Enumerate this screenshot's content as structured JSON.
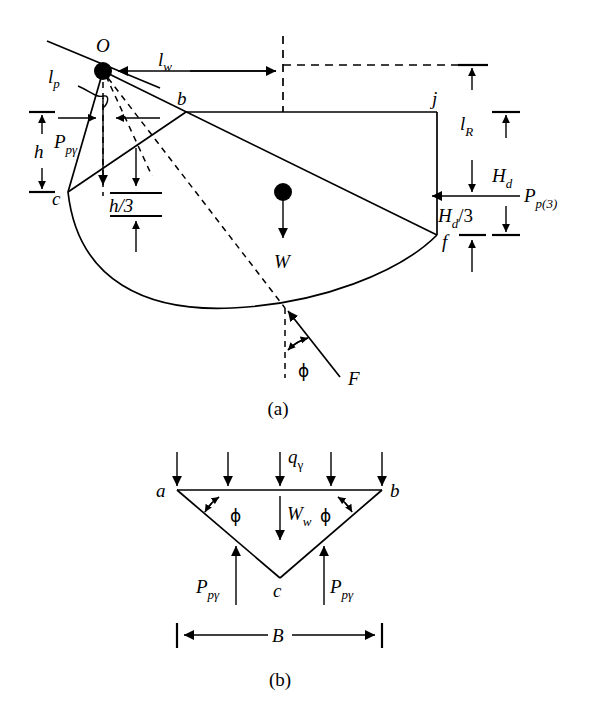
{
  "figure": {
    "title_panels": [
      "(a)",
      "(b)"
    ],
    "background_color": "#ffffff",
    "line_color": "#000000"
  },
  "panel_a": {
    "caption": "(a)",
    "points": [
      {
        "key": "O",
        "label": "O"
      },
      {
        "key": "b",
        "label": "b"
      },
      {
        "key": "c",
        "label": "c"
      },
      {
        "key": "f",
        "label": "f"
      },
      {
        "key": "j",
        "label": "j"
      }
    ],
    "dimensions": [
      {
        "key": "l_w",
        "base": "l",
        "sub": "w"
      },
      {
        "key": "l_p",
        "base": "l",
        "sub": "p"
      },
      {
        "key": "l_R",
        "base": "l",
        "sub": "R"
      },
      {
        "key": "h",
        "base": "h",
        "sub": ""
      },
      {
        "key": "h_over_3",
        "text": "h/3"
      },
      {
        "key": "H_d",
        "base": "H",
        "sub": "d"
      },
      {
        "key": "H_d_over_3",
        "base": "H",
        "sub": "d",
        "suffix": "/3"
      }
    ],
    "forces": [
      {
        "key": "P_p_gamma",
        "base": "P",
        "sub": "pγ"
      },
      {
        "key": "P_p3",
        "base": "P",
        "sub": "p(3)"
      },
      {
        "key": "W",
        "base": "W",
        "sub": ""
      },
      {
        "key": "F",
        "base": "F",
        "sub": ""
      }
    ],
    "angles": [
      {
        "key": "phi_F",
        "symbol": "ϕ"
      }
    ]
  },
  "panel_b": {
    "caption": "(b)",
    "points": [
      {
        "key": "a",
        "label": "a"
      },
      {
        "key": "b",
        "label": "b"
      },
      {
        "key": "c",
        "label": "c"
      }
    ],
    "loads": [
      {
        "key": "q_gamma",
        "base": "q",
        "sub": "γ"
      },
      {
        "key": "W_w",
        "base": "W",
        "sub": "w"
      },
      {
        "key": "P_p_gamma_left",
        "base": "P",
        "sub": "pγ"
      },
      {
        "key": "P_p_gamma_right",
        "base": "P",
        "sub": "pγ"
      }
    ],
    "angles": [
      {
        "key": "phi_left",
        "symbol": "ϕ"
      },
      {
        "key": "phi_right",
        "symbol": "ϕ"
      }
    ],
    "dimensions": [
      {
        "key": "B",
        "base": "B",
        "sub": ""
      }
    ]
  }
}
